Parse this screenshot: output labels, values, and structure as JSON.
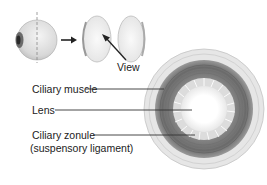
{
  "diagram": {
    "labels": {
      "view": "View",
      "ciliary_muscle": "Ciliary muscle",
      "lens": "Lens",
      "ciliary_zonule": "Ciliary zonule",
      "ciliary_zonule_sub": "(suspensory ligament)"
    },
    "colors": {
      "outer_ring": "#e3e3e3",
      "muscle_dark": "#6e6e6e",
      "muscle_mid": "#8a8a8a",
      "lens": "#ffffff",
      "line": "#333333"
    }
  }
}
